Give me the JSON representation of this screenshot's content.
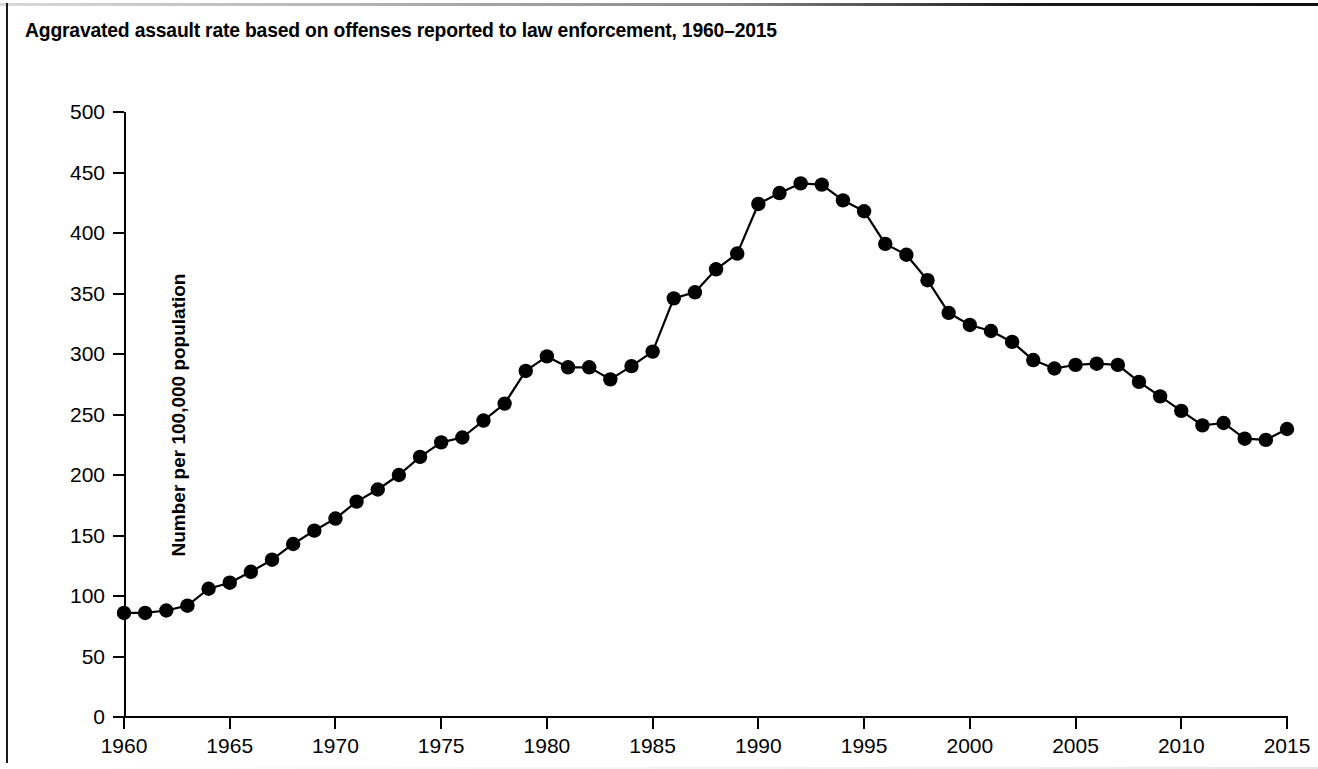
{
  "figure": {
    "title": "Aggravated assault rate based on offenses reported to law enforcement, 1960–2015",
    "background_color": "#ffffff",
    "line_color": "#000000",
    "marker_color": "#000000"
  },
  "axes": {
    "y_title": "Number per 100,000 population",
    "y_ticks": [
      "500",
      "450",
      "400",
      "350",
      "300",
      "250",
      "200",
      "150",
      "100",
      "50",
      "0"
    ],
    "x_ticks": [
      "1960",
      "1965",
      "1970",
      "1975",
      "1980",
      "1985",
      "1990",
      "1995",
      "2000",
      "2005",
      "2010",
      "2015"
    ]
  },
  "chart_data": {
    "type": "line",
    "title": "Aggravated assault rate based on offenses reported to law enforcement, 1960–2015",
    "xlabel": "",
    "ylabel": "Number per 100,000 population",
    "xlim": [
      1960,
      2015
    ],
    "ylim": [
      0,
      500
    ],
    "ytick_interval": 50,
    "xtick_interval": 5,
    "grid": false,
    "legend": "none",
    "markers": "filled-circle",
    "x": [
      1960,
      1961,
      1962,
      1963,
      1964,
      1965,
      1966,
      1967,
      1968,
      1969,
      1970,
      1971,
      1972,
      1973,
      1974,
      1975,
      1976,
      1977,
      1978,
      1979,
      1980,
      1981,
      1982,
      1983,
      1984,
      1985,
      1986,
      1987,
      1988,
      1989,
      1990,
      1991,
      1992,
      1993,
      1994,
      1995,
      1996,
      1997,
      1998,
      1999,
      2000,
      2001,
      2002,
      2003,
      2004,
      2005,
      2006,
      2007,
      2008,
      2009,
      2010,
      2011,
      2012,
      2013,
      2014,
      2015
    ],
    "values": [
      86,
      86,
      88,
      92,
      106,
      111,
      120,
      130,
      143,
      154,
      164,
      178,
      188,
      200,
      215,
      227,
      231,
      245,
      259,
      286,
      298,
      289,
      289,
      279,
      290,
      302,
      346,
      351,
      370,
      383,
      424,
      433,
      441,
      440,
      427,
      418,
      391,
      382,
      361,
      334,
      324,
      319,
      310,
      295,
      288,
      291,
      292,
      291,
      277,
      265,
      253,
      241,
      243,
      230,
      229,
      238
    ],
    "annotations": []
  }
}
